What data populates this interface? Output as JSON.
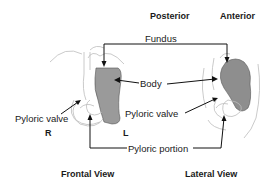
{
  "diagram": {
    "headers": {
      "posterior": "Posterior",
      "anterior": "Anterior"
    },
    "parts": {
      "fundus": "Fundus",
      "body": "Body",
      "pyloric_valve_left": "Pyloric valve",
      "pyloric_valve_right": "Pyloric valve",
      "pyloric_portion": "Pyloric portion"
    },
    "orientation": {
      "right": "R",
      "left": "L"
    },
    "views": {
      "frontal": "Frontal View",
      "lateral": "Lateral View"
    },
    "colors": {
      "line": "#111111",
      "stomach_fill": "#9a9a9a",
      "outline_faint": "#bdbdbd"
    }
  }
}
